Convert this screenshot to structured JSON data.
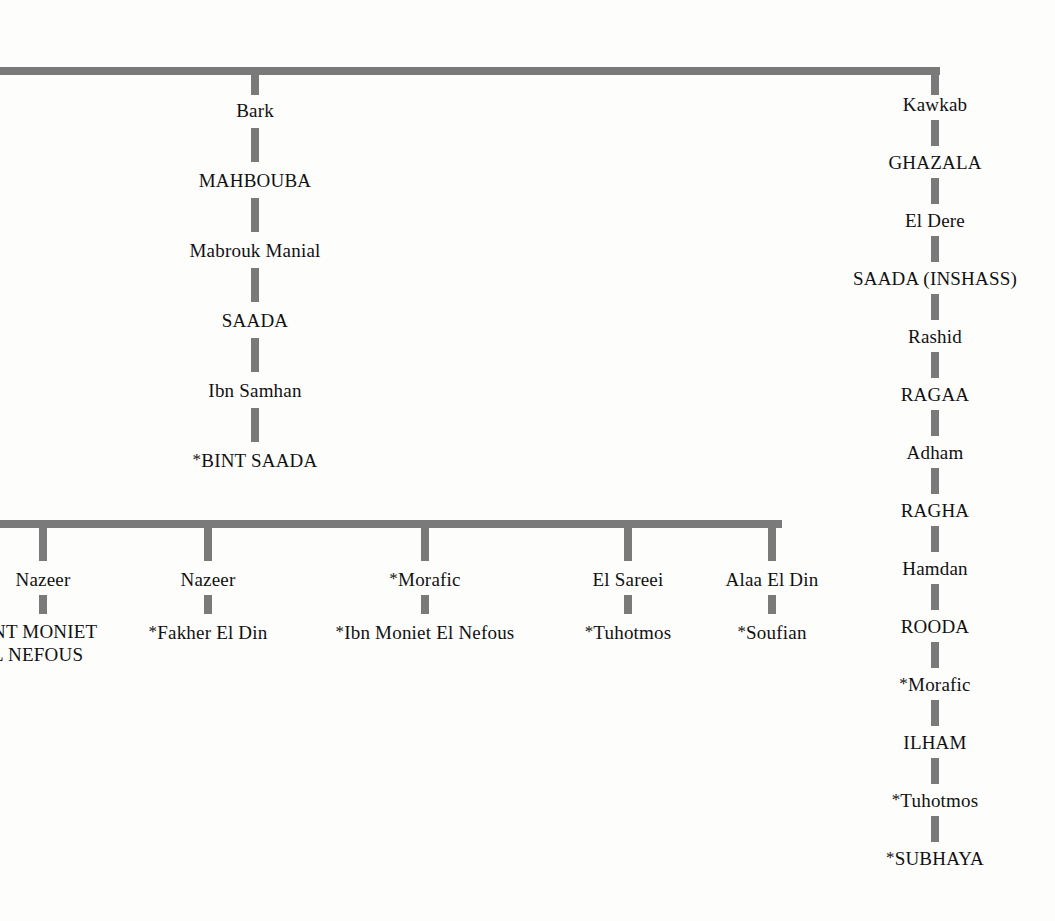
{
  "document": {
    "type": "horse-pedigree-chart",
    "note": "Arabian horse pedigree fragment; asterisk (*) prefix denotes imported horse",
    "asterisk_symbol": "*"
  },
  "colors": {
    "background": "#fdfdfb",
    "connector": "#7a7a7a",
    "text": "#111111"
  },
  "connectors": {
    "top_bar": {
      "x": 0,
      "y": 67,
      "width": 940,
      "left_truncated": true
    },
    "bottom_bar": {
      "x": 0,
      "y": 520,
      "width": 782,
      "left_truncated": true
    }
  },
  "left_chain": {
    "stem_x": 255,
    "entries": [
      {
        "label": "Bark",
        "caps": false,
        "imported": false
      },
      {
        "label": "MAHBOUBA",
        "caps": true,
        "imported": false
      },
      {
        "label": "Mabrouk Manial",
        "caps": false,
        "imported": false
      },
      {
        "label": "SAADA",
        "caps": true,
        "imported": false
      },
      {
        "label": "Ibn Samhan",
        "caps": false,
        "imported": false
      },
      {
        "label": "BINT SAADA",
        "caps": true,
        "imported": true
      }
    ]
  },
  "right_chain": {
    "stem_x": 935,
    "entries": [
      {
        "label": "Kawkab",
        "caps": false,
        "imported": false
      },
      {
        "label": "GHAZALA",
        "caps": true,
        "imported": false
      },
      {
        "label": "El Dere",
        "caps": false,
        "imported": false
      },
      {
        "label": "SAADA (INSHASS)",
        "caps": true,
        "imported": false
      },
      {
        "label": "Rashid",
        "caps": false,
        "imported": false
      },
      {
        "label": "RAGAA",
        "caps": true,
        "imported": false
      },
      {
        "label": "Adham",
        "caps": false,
        "imported": false
      },
      {
        "label": "RAGHA",
        "caps": true,
        "imported": false
      },
      {
        "label": "Hamdan",
        "caps": false,
        "imported": false
      },
      {
        "label": "ROODA",
        "caps": true,
        "imported": false
      },
      {
        "label": "Morafic",
        "caps": false,
        "imported": true
      },
      {
        "label": "ILHAM",
        "caps": true,
        "imported": false
      },
      {
        "label": "Tuhotmos",
        "caps": false,
        "imported": true
      },
      {
        "label": "SUBHAYA",
        "caps": true,
        "imported": true
      }
    ]
  },
  "bottom_branches": [
    {
      "stem_x": 43,
      "sire": {
        "label": "Nazeer",
        "caps": false,
        "imported": false
      },
      "offspring": {
        "label": "BINT MONIET EL NEFOUS",
        "display": "NT MONIET\nL NEFOUS",
        "caps": true,
        "imported": true,
        "truncated_at_left_edge": true
      }
    },
    {
      "stem_x": 208,
      "sire": {
        "label": "Nazeer",
        "caps": false,
        "imported": false
      },
      "offspring": {
        "label": "Fakher El Din",
        "caps": false,
        "imported": true
      }
    },
    {
      "stem_x": 425,
      "sire": {
        "label": "Morafic",
        "caps": false,
        "imported": true
      },
      "offspring": {
        "label": "Ibn Moniet El Nefous",
        "caps": false,
        "imported": true
      }
    },
    {
      "stem_x": 628,
      "sire": {
        "label": "El Sareei",
        "caps": false,
        "imported": false
      },
      "offspring": {
        "label": "Tuhotmos",
        "caps": false,
        "imported": true
      }
    },
    {
      "stem_x": 772,
      "sire": {
        "label": "Alaa El Din",
        "caps": false,
        "imported": false
      },
      "offspring": {
        "label": "Soufian",
        "caps": false,
        "imported": true
      }
    }
  ]
}
